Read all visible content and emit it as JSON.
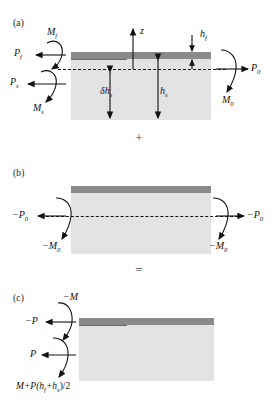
{
  "figure": {
    "type": "mechanics-superposition-diagram",
    "colors": {
      "film": "#8a8a8a",
      "substrate": "#e3e3e3",
      "ink": "#111111",
      "background": "#ffffff"
    },
    "operators": {
      "plus": "+",
      "equals": "="
    }
  },
  "panels": [
    {
      "id": "a",
      "label": "(a)",
      "labels": {
        "moment_film": "M",
        "moment_film_sub": "f",
        "force_film": "P",
        "force_film_sub": "f",
        "force_sub": "P",
        "force_sub_sub": "s",
        "moment_sub": "M",
        "moment_sub_sub": "s",
        "axis": "z",
        "film_thickness": "h",
        "film_thickness_sub": "f",
        "delta_depth": "δh",
        "delta_depth_sub": "s",
        "sub_thickness": "h",
        "sub_thickness_sub": "s",
        "force_right": "P",
        "force_right_sub": "0",
        "moment_right": "M",
        "moment_right_sub": "0"
      }
    },
    {
      "id": "b",
      "label": "(b)",
      "labels": {
        "force_left": "−P",
        "force_left_sub": "0",
        "moment_left": "−M",
        "moment_left_sub": "0",
        "force_right": "−P",
        "force_right_sub": "0",
        "moment_right": "−M",
        "moment_right_sub": "0"
      }
    },
    {
      "id": "c",
      "label": "(c)",
      "labels": {
        "moment_top": "−M",
        "force_top": "−P",
        "force_bottom": "P",
        "moment_bottom_expr": "M+P(h",
        "moment_bottom_sub1": "f",
        "moment_bottom_mid": "+h",
        "moment_bottom_sub2": "s",
        "moment_bottom_tail": ")/2"
      }
    }
  ]
}
